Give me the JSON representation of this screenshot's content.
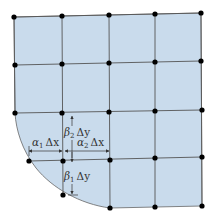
{
  "diagram": {
    "type": "finite-difference grid with curved boundary",
    "colors": {
      "fill": "#c9dbec",
      "grid_line": "#555555",
      "node": "#000000",
      "annotation": "#333333"
    },
    "columns_x": [
      14,
      62,
      109,
      155,
      201
    ],
    "rows_y": [
      16,
      63,
      112,
      159,
      207
    ],
    "grid_nodes": [
      [
        14,
        17
      ],
      [
        62,
        16
      ],
      [
        109,
        15
      ],
      [
        155,
        14
      ],
      [
        201,
        13
      ],
      [
        15,
        65
      ],
      [
        62,
        64
      ],
      [
        109,
        63
      ],
      [
        155,
        62
      ],
      [
        201,
        61
      ],
      [
        15,
        113
      ],
      [
        62,
        113
      ],
      [
        109,
        112
      ],
      [
        155,
        111
      ],
      [
        202,
        110
      ],
      [
        63,
        161
      ],
      [
        110,
        160
      ],
      [
        155,
        158
      ],
      [
        202,
        157
      ],
      [
        110,
        208
      ],
      [
        155,
        207
      ],
      [
        202,
        206
      ]
    ],
    "boundary_nodes": [
      [
        29,
        161
      ],
      [
        63,
        195
      ]
    ],
    "labels": {
      "beta2": {
        "greek": "β",
        "sub": "2",
        "delta": "Δy"
      },
      "alpha1": {
        "greek": "α",
        "sub": "1",
        "delta": "Δx"
      },
      "alpha2": {
        "greek": "α",
        "sub": "2",
        "delta": "Δx"
      },
      "beta1": {
        "greek": "β",
        "sub": "1",
        "delta": "Δy"
      }
    }
  }
}
